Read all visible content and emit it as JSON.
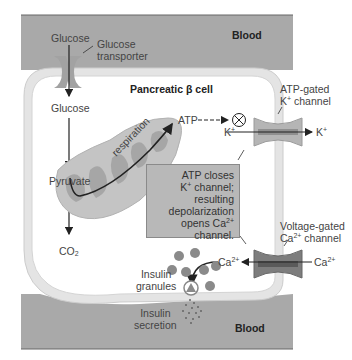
{
  "figure": {
    "regions": {
      "blood_top": "Blood",
      "blood_bottom": "Blood",
      "cell": "Pancreatic β cell"
    },
    "labels": {
      "glucose_outside": "Glucose",
      "glucose_transporter_line1": "Glucose",
      "glucose_transporter_line2": "transporter",
      "glucose_inside": "Glucose",
      "pyruvate": "Pyruvate",
      "co2_main": "CO",
      "co2_sub": "2",
      "respiration": "respiration",
      "atp": "ATP",
      "k_in_main": "K",
      "k_in_sup": "+",
      "k_out_main": "K",
      "k_out_sup": "+",
      "atp_channel_line1": "ATP-gated",
      "atp_channel_line2_main": "K",
      "atp_channel_line2_sup": "+",
      "atp_channel_line2_rest": " channel",
      "vg_channel_line1": "Voltage-gated",
      "vg_channel_line2_main": "Ca",
      "vg_channel_line2_sup": "2+",
      "vg_channel_line2_rest": " channel",
      "ca_in_main": "Ca",
      "ca_in_sup": "2+",
      "ca_out_main": "Ca",
      "ca_out_sup": "2+",
      "insulin_granules_line1": "Insulin",
      "insulin_granules_line2": "granules",
      "insulin_secretion_line1": "Insulin",
      "insulin_secretion_line2": "secretion"
    },
    "callout": {
      "line1": "ATP closes",
      "line2_main": "K",
      "line2_sup": "+",
      "line2_rest": " channel;",
      "line3": "resulting",
      "line4": "depolarization",
      "line5_main": "opens Ca",
      "line5_sup": "2+",
      "line6": "channel."
    },
    "colors": {
      "blood": "#a9a9a9",
      "membrane": "#e6e6e6",
      "membrane_edge": "#cfcfcf",
      "mitochondrion": "#c4c4c4",
      "cristae": "#a6a6a6",
      "k_channel": "#b5b5b5",
      "ca_channel": "#7d7d7d",
      "granule": "#8a8a8a",
      "callout_box": "#b8b8b8"
    }
  }
}
